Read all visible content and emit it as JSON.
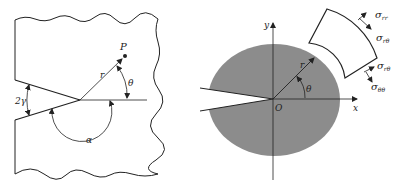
{
  "left_panel": {
    "labels": {
      "point": "P",
      "radius": "r",
      "theta": "θ",
      "notch_angle": "2γ",
      "alpha": "α"
    }
  },
  "right_panel": {
    "labels": {
      "y_axis": "y",
      "x_axis": "x",
      "origin": "O",
      "radius": "r",
      "theta": "θ"
    },
    "stresses": {
      "s1_main": "σ",
      "s1_sub": "rr",
      "s2_main": "σ",
      "s2_sub": "rθ",
      "s3_main": "σ",
      "s3_sub": "rθ",
      "s4_main": "σ",
      "s4_sub": "θθ"
    },
    "colors": {
      "region_fill": "#8c8c8c"
    }
  }
}
